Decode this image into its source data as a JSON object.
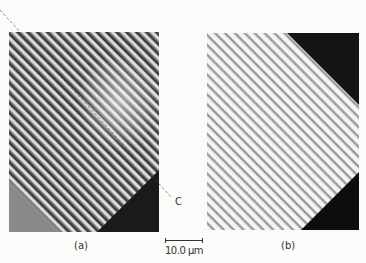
{
  "figure": {
    "panels": [
      {
        "id": "a",
        "label": "(a)",
        "description": "micrograph with diagonal striations, grey lower-left corner, dark lower-right corner"
      },
      {
        "id": "b",
        "label": "(b)",
        "description": "micrograph with diagonal striations, dark upper-right and lower-right corners"
      }
    ],
    "annotation_line_label": "C",
    "scale_bar": {
      "text": "10.0 μm",
      "value": 10.0,
      "unit": "μm"
    }
  }
}
